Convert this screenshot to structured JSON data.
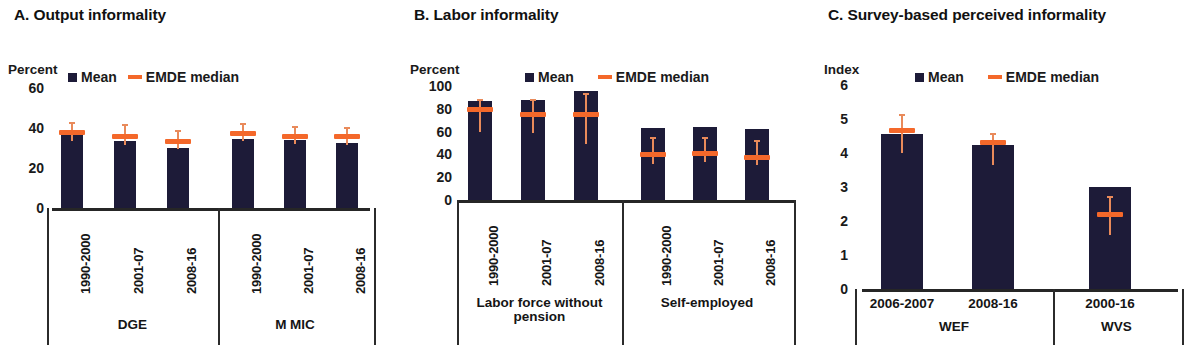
{
  "figure": {
    "legend": {
      "mean_label": "Mean",
      "median_label": "EMDE median",
      "mean_color": "#1d1b38",
      "median_color": "#f4682a"
    }
  },
  "panels": [
    {
      "id": "A",
      "title": "A. Output informality",
      "unit": "Percent",
      "yticks": [
        "60",
        "40",
        "20",
        "0"
      ],
      "group_labels": [
        "DGE",
        "M MIC"
      ],
      "categories": [
        "1990-2000",
        "2001-07",
        "2008-16",
        "1990-2000",
        "2001-07",
        "2008-16"
      ]
    },
    {
      "id": "B",
      "title": "B. Labor informality",
      "unit": "Percent",
      "yticks": [
        "100",
        "80",
        "60",
        "40",
        "20",
        "0"
      ],
      "group_labels": [
        "Labor force without pension",
        "Self-employed"
      ],
      "categories": [
        "1990-2000",
        "2001-07",
        "2008-16",
        "1990-2000",
        "2001-07",
        "2008-16"
      ]
    },
    {
      "id": "C",
      "title": "C. Survey-based perceived informality",
      "unit": "Index",
      "yticks": [
        "6",
        "5",
        "4",
        "3",
        "2",
        "1",
        "0"
      ],
      "group_labels": [
        "WEF",
        "WVS"
      ],
      "categories": [
        "2006-2007",
        "2008-16",
        "2000-16"
      ]
    }
  ],
  "chart_data": [
    {
      "type": "bar",
      "panel": "A",
      "title": "A. Output informality",
      "ylabel": "Percent",
      "xlabel": "",
      "ylim": [
        0,
        60
      ],
      "yticks": [
        0,
        20,
        40,
        60
      ],
      "grid": false,
      "legend": [
        "Mean",
        "EMDE median"
      ],
      "legend_position": "top",
      "groups": [
        "DGE",
        "M MIC"
      ],
      "categories": [
        "1990-2000",
        "2001-07",
        "2008-16",
        "1990-2000",
        "2001-07",
        "2008-16"
      ],
      "series": [
        {
          "name": "Mean",
          "values": [
            37.0,
            33.5,
            30.0,
            34.5,
            34.0,
            32.5
          ]
        },
        {
          "name": "EMDE median",
          "values": [
            38.0,
            36.0,
            33.5,
            37.5,
            36.0,
            36.0
          ]
        }
      ],
      "error_bars": [
        {
          "low": 33.5,
          "high": 43.0
        },
        {
          "low": 31.5,
          "high": 42.0
        },
        {
          "low": 29.5,
          "high": 39.0
        },
        {
          "low": 33.5,
          "high": 42.5
        },
        {
          "low": 32.0,
          "high": 41.0
        },
        {
          "low": 31.5,
          "high": 40.5
        }
      ]
    },
    {
      "type": "bar",
      "panel": "B",
      "title": "B. Labor informality",
      "ylabel": "Percent",
      "xlabel": "",
      "ylim": [
        0,
        100
      ],
      "yticks": [
        0,
        20,
        40,
        60,
        80,
        100
      ],
      "grid": false,
      "legend": [
        "Mean",
        "EMDE median"
      ],
      "legend_position": "top",
      "groups": [
        "Labor force without pension",
        "Self-employed"
      ],
      "categories": [
        "1990-2000",
        "2001-07",
        "2008-16",
        "1990-2000",
        "2001-07",
        "2008-16"
      ],
      "series": [
        {
          "name": "Mean",
          "values": [
            87.0,
            87.5,
            96.0,
            63.5,
            64.0,
            62.5
          ]
        },
        {
          "name": "EMDE median",
          "values": [
            79.0,
            75.0,
            75.0,
            39.5,
            40.5,
            37.0
          ]
        }
      ],
      "error_bars": [
        {
          "low": 60.0,
          "high": 89.0
        },
        {
          "low": 59.0,
          "high": 89.0
        },
        {
          "low": 49.0,
          "high": 94.0
        },
        {
          "low": 32.0,
          "high": 55.0
        },
        {
          "low": 33.0,
          "high": 55.0
        },
        {
          "low": 31.0,
          "high": 53.0
        }
      ]
    },
    {
      "type": "bar",
      "panel": "C",
      "title": "C. Survey-based perceived informality",
      "ylabel": "Index",
      "xlabel": "",
      "ylim": [
        0,
        6
      ],
      "yticks": [
        0,
        1,
        2,
        3,
        4,
        5,
        6
      ],
      "grid": false,
      "legend": [
        "Mean",
        "EMDE median"
      ],
      "legend_position": "top",
      "groups": [
        "WEF",
        "WVS"
      ],
      "categories": [
        "2006-2007",
        "2008-16",
        "2000-16"
      ],
      "series": [
        {
          "name": "Mean",
          "values": [
            4.55,
            4.25,
            3.0
          ]
        },
        {
          "name": "EMDE median",
          "values": [
            4.65,
            4.3,
            2.2
          ]
        },
        {
          "name": "EMDE median WVS",
          "values": [
            null,
            null,
            2.2
          ]
        }
      ],
      "error_bars": [
        {
          "low": 4.0,
          "high": 5.15
        },
        {
          "low": 3.65,
          "high": 4.6
        },
        {
          "low": 1.6,
          "high": 2.75
        }
      ]
    }
  ]
}
